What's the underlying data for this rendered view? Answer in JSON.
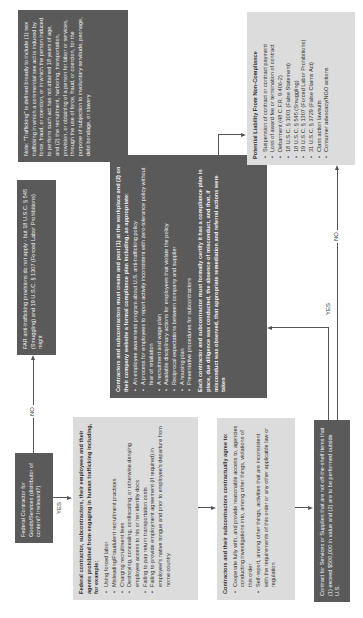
{
  "flowchart": {
    "start": {
      "text": "Federal Contractor for Goods/Services (distributor of content? Irrelevant?)"
    },
    "far_not_apply": {
      "text": "FAR anti-trafficking provisions do not apply - but 18 U.S.C. § 545 (Smuggling) and 19 U.S.C. § 1307 (Forced Labor Prohibitions) might"
    },
    "note": {
      "text": "Note: \"Trafficking\" is defined broadly to include (1) sex trafficking in which a commercial sex act is induced by force, fraud, or coercion, or in which the person induced to perform such act has not attained 18 years of age, and (2) the recruitment, harboring, transportation, provision, or obtaining of a person for labor or services, through the use of force, fraud, or coercion, for the purpose of subjection to involuntary servitude, peonage, debt bondage, or slavery"
    },
    "prohibited": {
      "title": "Federal contractor, subcontractors, their employees and their agents prohibited from engaging in human trafficking including, for example:",
      "items": [
        "Using forced labor",
        "Misleading/Fraudulent recruitment practices",
        "Charging recruitment fees",
        "Destroying, concealing, confiscating, or otherwise denying employee access to his or her identity docs",
        "Failing to pay return transportation costs",
        "Failing to provide employment agreement (if required) in employee's native tongue and prior to employee's departure from home country"
      ]
    },
    "compliance_plan": {
      "title": "Contractors and subcontractors must create and post (1) at the workplace and (2) on their company website a formal compliance plan including, as appropriate:",
      "items": [
        "An employee awareness program about U.S. anti-trafficking policy",
        "A process for employees to report activity inconsistent with zero-tolerance policy without fear of retaliation",
        "A recruitment and wage plan",
        "Available disciplinary actions for employees that violate the policy",
        "Reciprocal expectations between company and supplier",
        "A housing plan",
        "Preventative procedures for subcontractors"
      ],
      "closing": "Each contractor and subcontractor must formally certify it has a compliance plan in place, due diligence was conducted, the absence of misconduct, and that, if misconduct was observed, that appropriate remediation and referral actions were taken"
    },
    "contractual": {
      "title": "Contractors and their subcontractors contractually agree to:",
      "items": [
        "Cooperate fully with, and provide reasonable access to, agencies conducting investigations into, among other things, violations of this order",
        "Self-report, among other things, activities that are inconsistent with the requirements of this order or any other applicable law or regulation"
      ]
    },
    "contract_services": {
      "text": "Contract for Services or Supplies that are not off-the-shelf items that (1) exceed $500,000 in value and (2) are to be performed outside U.S."
    },
    "liability": {
      "title": "Potential Liability From Non-Compliance",
      "items": [
        "Suspension of contract or contract payment",
        "Loss of award fee or termination of contract",
        "Debarment (48 C.F.R. 9.406-2)",
        "18 U.S.C. § 1001 (False Statement)",
        "18 U.S.C. § 545 (Smuggling)",
        "19 U.S.C. § 1307 (Forced Labor Prohibitions)",
        "31 U.S.C. § 3729 (False Claims Act)",
        "Class action lawsuits",
        "Consumer advocacy/NGO actions"
      ]
    },
    "edges": {
      "start_no": "NO",
      "start_yes": "YES",
      "services_yes": "YES",
      "services_no": "NO"
    },
    "colors": {
      "dark_box": "#5a5a5a",
      "light_box": "#dcdcdc",
      "connector": "#555555"
    }
  }
}
